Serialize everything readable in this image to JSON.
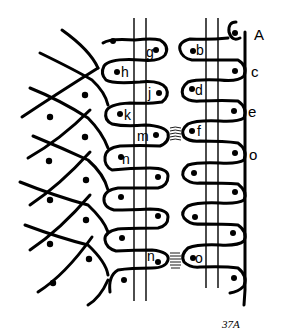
{
  "figure": {
    "caption": "37A",
    "colors": {
      "ink": "#000000",
      "background": "#ffffff"
    },
    "edge_labels": [
      {
        "text": "A",
        "x": 256,
        "y": 40
      },
      {
        "text": "c",
        "x": 251,
        "y": 77
      },
      {
        "text": "e",
        "x": 248,
        "y": 117
      },
      {
        "text": "o",
        "x": 249,
        "y": 160
      }
    ],
    "loop_labels": [
      {
        "text": "g",
        "x": 146,
        "y": 57
      },
      {
        "text": "h",
        "x": 121,
        "y": 77
      },
      {
        "text": "j",
        "x": 148,
        "y": 98
      },
      {
        "text": "k",
        "x": 124,
        "y": 120
      },
      {
        "text": "m",
        "x": 137,
        "y": 141
      },
      {
        "text": "n",
        "x": 122,
        "y": 164
      },
      {
        "text": "n",
        "x": 147,
        "y": 261
      },
      {
        "text": "b",
        "x": 196,
        "y": 55
      },
      {
        "text": "d",
        "x": 195,
        "y": 95
      },
      {
        "text": "f",
        "x": 197,
        "y": 136
      },
      {
        "text": "o",
        "x": 195,
        "y": 263
      }
    ]
  }
}
